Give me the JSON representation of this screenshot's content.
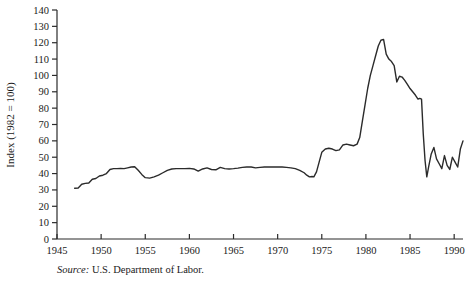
{
  "chart_data": {
    "type": "line",
    "title": "",
    "subtitle": "",
    "xlabel": "",
    "ylabel": "Index (1982 = 100)",
    "xlim": [
      1945,
      1991
    ],
    "ylim": [
      0,
      140
    ],
    "grid": false,
    "legend": null,
    "legend_position": "none",
    "line_color": "#2b2b2b",
    "y_ticks": [
      0,
      10,
      20,
      30,
      40,
      50,
      60,
      70,
      80,
      90,
      100,
      110,
      120,
      130,
      140
    ],
    "y_tick_labels": [
      "0",
      "10",
      "20",
      "30",
      "40",
      "50",
      "60",
      "70",
      "80",
      "90",
      "100",
      "110",
      "120",
      "130",
      "140"
    ],
    "x_ticks": [
      1945,
      1950,
      1955,
      1960,
      1965,
      1970,
      1975,
      1980,
      1985,
      1990
    ],
    "x_tick_labels": [
      "1945",
      "1950",
      "1955",
      "1960",
      "1965",
      "1970",
      "1975",
      "1980",
      "1985",
      "1990"
    ],
    "x": [
      1947.0,
      1947.4,
      1947.8,
      1948.2,
      1948.6,
      1949.0,
      1949.4,
      1949.8,
      1950.2,
      1950.6,
      1951.0,
      1951.4,
      1951.8,
      1952.2,
      1952.6,
      1953.0,
      1953.4,
      1953.8,
      1954.2,
      1954.6,
      1955.0,
      1955.5,
      1956.0,
      1956.5,
      1957.0,
      1957.5,
      1958.0,
      1958.5,
      1959.0,
      1959.5,
      1960.0,
      1960.5,
      1961.0,
      1961.5,
      1962.0,
      1962.5,
      1963.0,
      1963.5,
      1964.0,
      1964.5,
      1965.0,
      1965.5,
      1966.0,
      1966.5,
      1967.0,
      1967.5,
      1968.0,
      1968.5,
      1969.0,
      1969.5,
      1970.0,
      1970.5,
      1971.0,
      1971.5,
      1972.0,
      1972.5,
      1973.0,
      1973.3,
      1973.6,
      1973.9,
      1974.1,
      1974.4,
      1974.7,
      1975.0,
      1975.4,
      1975.8,
      1976.2,
      1976.6,
      1977.0,
      1977.4,
      1977.8,
      1978.2,
      1978.6,
      1979.0,
      1979.3,
      1979.6,
      1979.9,
      1980.2,
      1980.5,
      1980.8,
      1981.1,
      1981.4,
      1981.7,
      1982.0,
      1982.3,
      1982.6,
      1982.9,
      1983.2,
      1983.5,
      1983.8,
      1984.1,
      1984.4,
      1984.7,
      1985.0,
      1985.3,
      1985.6,
      1985.9,
      1986.1,
      1986.3,
      1986.5,
      1986.7,
      1986.9,
      1987.1,
      1987.4,
      1987.7,
      1988.0,
      1988.3,
      1988.6,
      1988.9,
      1989.2,
      1989.5,
      1989.8,
      1990.1,
      1990.4,
      1990.7,
      1991.0
    ],
    "values": [
      31.0,
      31.2,
      33.5,
      34.0,
      34.2,
      36.5,
      37.0,
      38.5,
      39.0,
      40.0,
      42.5,
      43.0,
      43.0,
      43.2,
      43.0,
      43.5,
      44.0,
      44.2,
      42.0,
      39.5,
      37.5,
      37.2,
      38.0,
      39.0,
      40.5,
      42.0,
      42.8,
      43.0,
      43.0,
      43.0,
      43.2,
      42.8,
      41.5,
      42.8,
      43.5,
      42.5,
      42.3,
      43.8,
      43.0,
      42.8,
      43.0,
      43.3,
      43.8,
      44.0,
      44.0,
      43.5,
      43.8,
      44.0,
      44.0,
      44.0,
      44.0,
      44.0,
      43.8,
      43.5,
      43.0,
      42.0,
      40.5,
      39.0,
      38.0,
      38.2,
      38.0,
      41.0,
      47.0,
      53.0,
      55.0,
      55.5,
      55.0,
      54.0,
      54.5,
      57.5,
      58.0,
      57.5,
      57.0,
      58.0,
      62.0,
      72.0,
      82.0,
      92.0,
      100.0,
      106.0,
      112.0,
      118.0,
      121.5,
      122.0,
      113.0,
      110.0,
      108.5,
      106.0,
      96.0,
      99.5,
      99.0,
      97.0,
      94.5,
      92.0,
      90.0,
      88.0,
      85.5,
      86.0,
      85.5,
      64.0,
      48.0,
      38.0,
      44.0,
      52.0,
      56.0,
      49.0,
      46.0,
      43.0,
      51.0,
      45.0,
      42.5,
      50.0,
      47.0,
      44.0,
      55.0,
      60.0
    ]
  },
  "footnote": {
    "source_word": "Source:",
    "source_text": " U.S. Department of Labor."
  }
}
